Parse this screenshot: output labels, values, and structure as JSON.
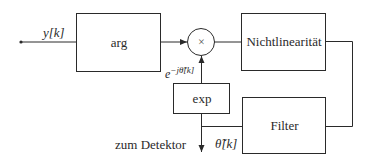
{
  "diagram": {
    "input_label": "y[k]",
    "blocks": {
      "arg": "arg",
      "multiplier": "×",
      "nonlinearity": "Nichtlinearität",
      "exp": "exp",
      "filter": "Filter"
    },
    "labels": {
      "feedback": "e^{-j θ̃[k]}",
      "feedback_base": "e",
      "feedback_exp": "−jθ̃[k]",
      "output_text": "zum Detektor",
      "output_symbol": "θ̃[k]"
    },
    "colors": {
      "line": "#2a2a2a",
      "background": "#ffffff"
    }
  }
}
